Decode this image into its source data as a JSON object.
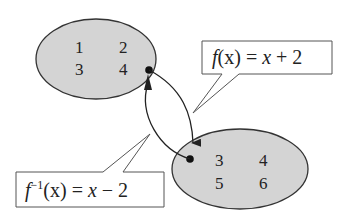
{
  "diagram": {
    "domain_set": {
      "values": [
        "1",
        "2",
        "3",
        "4"
      ],
      "fill": "#d4d4d4"
    },
    "range_set": {
      "values": [
        "3",
        "4",
        "5",
        "6"
      ],
      "fill": "#d4d4d4"
    },
    "function_label": {
      "f": "f",
      "arg": "(x)",
      "rest": " = ",
      "x": "x",
      "tail": " + 2"
    },
    "inverse_label": {
      "f": "f",
      "sup": "−1",
      "arg": "(x)",
      "rest": " = ",
      "x": "x",
      "tail": " − 2"
    }
  }
}
